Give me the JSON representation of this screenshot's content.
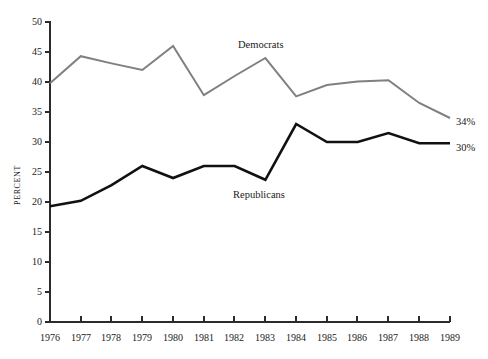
{
  "chart_data": {
    "type": "line",
    "title": "",
    "subtitle": "",
    "xlabel": "",
    "ylabel": "PERCENT",
    "x": [
      1976,
      1977,
      1978,
      1979,
      1980,
      1981,
      1982,
      1983,
      1984,
      1985,
      1986,
      1987,
      1988,
      1989
    ],
    "xtick_labels": [
      "1976",
      "1977",
      "1978",
      "1979",
      "1980",
      "1981",
      "1982",
      "1983",
      "1984",
      "1985",
      "1986",
      "1987",
      "1988",
      "1989"
    ],
    "xlim": [
      1976,
      1989
    ],
    "ylim": [
      0,
      50
    ],
    "ytick_values": [
      0,
      5,
      10,
      15,
      20,
      25,
      30,
      35,
      40,
      45,
      50
    ],
    "ytick_labels": [
      "0",
      "5",
      "10",
      "15",
      "20",
      "25",
      "30",
      "35",
      "40",
      "45",
      "50"
    ],
    "grid": false,
    "legend": "inline-annotations",
    "series": [
      {
        "name": "Democrats",
        "color": "#808080",
        "line_width": 2.0,
        "values": [
          39.8,
          44.3,
          43.1,
          42.0,
          46.0,
          37.8,
          41.0,
          44.0,
          37.6,
          39.5,
          40.1,
          40.3,
          36.5,
          34.0
        ],
        "end_label": "34%",
        "annotation_label": "Democrats"
      },
      {
        "name": "Republicans",
        "color": "#111111",
        "line_width": 2.6,
        "values": [
          19.3,
          20.2,
          22.8,
          26.0,
          24.0,
          26.0,
          26.0,
          23.7,
          33.0,
          30.0,
          30.0,
          31.5,
          29.8,
          29.8
        ],
        "end_label": "30%",
        "annotation_label": "Republicans"
      }
    ],
    "annotations": [
      {
        "text": "Democrats",
        "series": "Democrats"
      },
      {
        "text": "Republicans",
        "series": "Republicans"
      },
      {
        "text": "34%",
        "series": "Democrats"
      },
      {
        "text": "30%",
        "series": "Republicans"
      }
    ]
  },
  "axis": {
    "y_title": "PERCENT",
    "y_ticks": [
      "50",
      "45",
      "40",
      "35",
      "30",
      "25",
      "20",
      "15",
      "10",
      "5",
      "0"
    ],
    "x_ticks": [
      "1976",
      "1977",
      "1978",
      "1979",
      "1980",
      "1981",
      "1982",
      "1983",
      "1984",
      "1985",
      "1986",
      "1987",
      "1988",
      "1989"
    ]
  },
  "labels": {
    "democrats": "Democrats",
    "republicans": "Republicans",
    "democrats_end": "34%",
    "republicans_end": "30%"
  }
}
